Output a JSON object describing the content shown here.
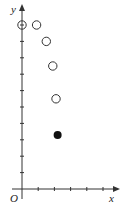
{
  "chart_data": {
    "type": "scatter",
    "title": "",
    "xlabel": "x",
    "ylabel": "y",
    "origin_label": "O",
    "xlim": [
      0,
      6
    ],
    "ylim": [
      0,
      10
    ],
    "x_ticks": [
      1,
      2,
      3,
      4,
      5
    ],
    "y_ticks": [
      1,
      2,
      3,
      4,
      5,
      6,
      7,
      8,
      9,
      10
    ],
    "tick_labels_shown": false,
    "grid": false,
    "legend": null,
    "series": [
      {
        "name": "open points",
        "marker": "open-circle",
        "points": [
          {
            "x": 0,
            "y": 10
          },
          {
            "x": 0.9,
            "y": 10
          },
          {
            "x": 1.5,
            "y": 9
          },
          {
            "x": 1.9,
            "y": 7.5
          },
          {
            "x": 2.1,
            "y": 5.5
          }
        ]
      },
      {
        "name": "filled point",
        "marker": "filled-circle",
        "points": [
          {
            "x": 2.2,
            "y": 3.3
          }
        ]
      }
    ]
  },
  "colors": {
    "axis": "#333333",
    "marker_stroke": "#333333",
    "marker_fill_filled": "#111111",
    "background": "#ffffff"
  }
}
